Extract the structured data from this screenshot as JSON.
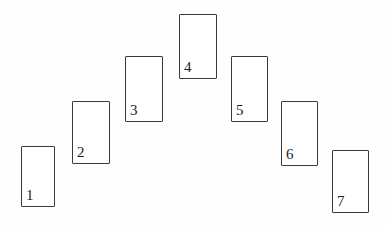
{
  "figure": {
    "background_color": "#fefefe",
    "card_fill_color": "#ffffff",
    "card_border_color": "#3a3a3a",
    "label_color": "#1c1c1c",
    "width": 388,
    "height": 228
  },
  "cards": [
    {
      "label": "1",
      "x": 21,
      "y": 146,
      "w": 34,
      "h": 61
    },
    {
      "label": "2",
      "x": 72,
      "y": 101,
      "w": 38,
      "h": 63
    },
    {
      "label": "3",
      "x": 125,
      "y": 56,
      "w": 38,
      "h": 66
    },
    {
      "label": "4",
      "x": 179,
      "y": 14,
      "w": 38,
      "h": 65
    },
    {
      "label": "5",
      "x": 231,
      "y": 56,
      "w": 37,
      "h": 66
    },
    {
      "label": "6",
      "x": 281,
      "y": 101,
      "w": 37,
      "h": 65
    },
    {
      "label": "7",
      "x": 332,
      "y": 150,
      "w": 37,
      "h": 63
    }
  ]
}
